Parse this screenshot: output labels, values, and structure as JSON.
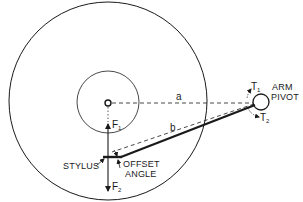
{
  "diagram": {
    "colors": {
      "ink": "#1a1a1a",
      "background": "#ffffff"
    },
    "labels": {
      "arm_pivot_line1": "ARM",
      "arm_pivot_line2": "PIVOT",
      "distance_a": "a",
      "distance_b": "b",
      "force_f1": "F",
      "force_f1_sub": "1",
      "force_f2": "F",
      "force_f2_sub": "2",
      "torque_t1": "T",
      "torque_t1_sub": "1",
      "torque_t2": "T",
      "torque_t2_sub": "2",
      "stylus": "STYLUS",
      "offset_angle_line1": "OFFSET",
      "offset_angle_line2": "ANGLE"
    },
    "elements": [
      "record-outer-circle",
      "label-area-circle",
      "spindle",
      "arm-pivot",
      "tonearm",
      "pivot-to-spindle-line-a",
      "pivot-to-stylus-line-b",
      "force-arrow-f1",
      "force-arrow-f2",
      "torque-arrow-t1",
      "torque-arrow-t2"
    ]
  }
}
